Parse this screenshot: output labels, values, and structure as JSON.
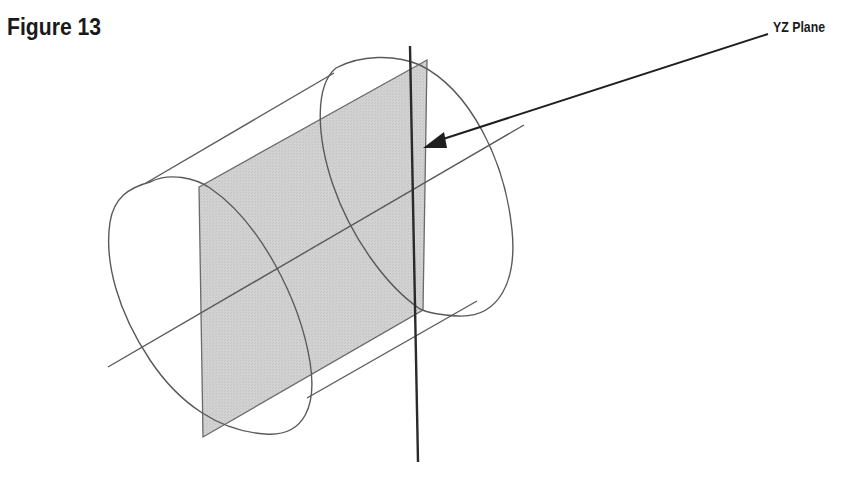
{
  "figure": {
    "title": "Figure 13",
    "callout_label": "YZ Plane",
    "colors": {
      "background": "#ffffff",
      "plane_fill": "#cfcfcf",
      "wireframe": "#5a5a5a",
      "axis_z": "#2a2a2a",
      "arrow": "#1e1e1e",
      "text": "#1a1a1a"
    },
    "elements": [
      {
        "name": "cylinder",
        "type": "wireframe",
        "description": "cylinder drawn in isometric projection"
      },
      {
        "name": "yz-plane",
        "type": "shaded-plane",
        "description": "shaded rectangular plane through cylinder axis"
      },
      {
        "name": "x-axis",
        "type": "line",
        "description": "cylinder axis line"
      },
      {
        "name": "z-axis",
        "type": "line",
        "description": "vertical axis"
      },
      {
        "name": "callout-arrow",
        "type": "arrow",
        "points_to": "yz-plane"
      }
    ]
  }
}
